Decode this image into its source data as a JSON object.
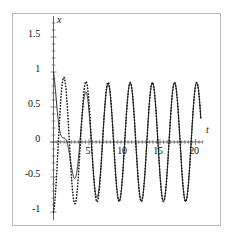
{
  "figure": {
    "background": "#ffffff",
    "frame_color": "#b9b9b9",
    "curve_color": "#1a1a1a"
  },
  "axis_names": {
    "x_axis_name": "t",
    "y_axis_name": "x"
  },
  "chart_data": {
    "type": "line",
    "title": "",
    "xlabel": "t",
    "ylabel": "x",
    "xlim": [
      -0.6,
      21.0
    ],
    "ylim": [
      -1.15,
      1.85
    ],
    "grid": false,
    "legend": null,
    "xticks": [
      5,
      10,
      15,
      20
    ],
    "xtick_labels": [
      "5",
      "10",
      "15",
      "20"
    ],
    "yticks": [
      -1,
      -0.5,
      0,
      0.5,
      1,
      1.5
    ],
    "ytick_labels": [
      "-1",
      "-0.5",
      "0",
      "0.5",
      "1",
      "1.5"
    ],
    "origin_label": "0",
    "series": [
      {
        "name": "solid-curve",
        "style": "solid",
        "initial_value": 1.0,
        "first_peak": 1.72,
        "first_peak_t": 0.95,
        "steady_amplitude": 0.85,
        "period": 3.12,
        "phase": 1.35,
        "decay": 0.55
      },
      {
        "name": "dotted-curve",
        "style": "dotted",
        "initial_value": -1.0,
        "first_peak": 0.83,
        "first_peak_t": 1.95,
        "steady_amplitude": 0.85,
        "period": 3.12,
        "phase": 1.35,
        "decay": 0.55
      }
    ]
  }
}
